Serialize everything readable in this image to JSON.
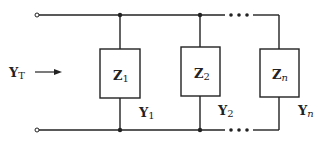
{
  "diagram": {
    "type": "parallel-admittance-network",
    "input": {
      "label": "Y",
      "sub": "T"
    },
    "branches": [
      {
        "impedance": {
          "label": "Z",
          "sub": "1"
        },
        "admittance": {
          "label": "Y",
          "sub": "1"
        }
      },
      {
        "impedance": {
          "label": "Z",
          "sub": "2"
        },
        "admittance": {
          "label": "Y",
          "sub": "2"
        }
      },
      {
        "impedance": {
          "label": "Z",
          "sub": "n"
        },
        "admittance": {
          "label": "Y",
          "sub": "n"
        }
      }
    ],
    "ellipsis": "•••",
    "colors": {
      "line": "#222222",
      "background": "#ffffff"
    }
  }
}
